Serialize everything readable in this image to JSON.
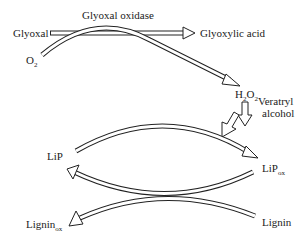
{
  "diagram": {
    "type": "reaction-pathway",
    "nodes": {
      "glyoxal": "Glyoxal",
      "enzyme": "Glyoxal oxidase",
      "glyoxylic_acid": "Glyoxylic acid",
      "o2": {
        "base": "O",
        "sub": "2"
      },
      "h2o2": {
        "p1": "H",
        "s1": "2",
        "p2": "O",
        "s2": "2"
      },
      "veratryl_line1": "Veratryl",
      "veratryl_line2": "alcohol",
      "lip": "LiP",
      "lipox": {
        "base": "LiP",
        "sub": "ox"
      },
      "lignin_ox": {
        "base": "Lignin",
        "sub": "ox"
      },
      "lignin": "Lignin"
    },
    "edges": [
      {
        "from": "Glyoxal",
        "to": "Glyoxylic acid",
        "label": "Glyoxal oxidase"
      },
      {
        "from": "O2",
        "to": "H2O2"
      },
      {
        "from": "H2O2",
        "to": "LiP→LiPox"
      },
      {
        "from": "Veratryl alcohol",
        "to": "LiP→LiPox"
      },
      {
        "from": "LiP",
        "to": "LiPox"
      },
      {
        "from": "LiPox",
        "to": "LiP"
      },
      {
        "from": "Lignin",
        "to": "Ligninox"
      }
    ],
    "colors": {
      "stroke": "#222222",
      "background": "#ffffff"
    }
  }
}
